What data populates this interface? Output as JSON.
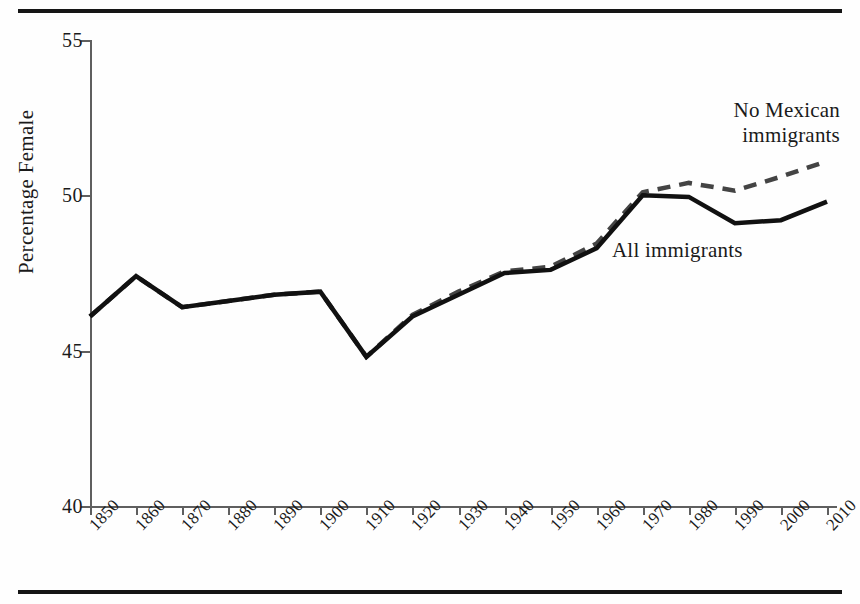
{
  "chart_data": {
    "type": "line",
    "title": "",
    "subtitle": "",
    "xlabel": "",
    "ylabel": "Percentage Female",
    "x": [
      1850,
      1860,
      1870,
      1880,
      1890,
      1900,
      1910,
      1920,
      1930,
      1940,
      1950,
      1960,
      1970,
      1980,
      1990,
      2000,
      2010
    ],
    "xtick_labels": [
      "1850",
      "1860",
      "1870",
      "1880",
      "1890",
      "1900",
      "1910",
      "1920",
      "1930",
      "1940",
      "1950",
      "1960",
      "1970",
      "1980",
      "1990",
      "2000",
      "2010"
    ],
    "ytick_labels": [
      "40",
      "45",
      "50",
      "55"
    ],
    "yticks": [
      40,
      45,
      50,
      55
    ],
    "xlim": [
      1850,
      2010
    ],
    "ylim": [
      40,
      55
    ],
    "grid": false,
    "legend_position": "inline-annotation",
    "series": [
      {
        "name": "All immigrants",
        "style": "solid",
        "color": "#111111",
        "values": [
          46.1,
          47.4,
          46.4,
          46.6,
          46.8,
          46.9,
          44.8,
          46.1,
          46.8,
          47.5,
          47.6,
          48.3,
          50.0,
          49.95,
          49.1,
          49.2,
          49.8
        ]
      },
      {
        "name": "No Mexican immigrants",
        "style": "dashed",
        "color": "#444444",
        "values": [
          46.1,
          47.4,
          46.4,
          46.6,
          46.8,
          46.9,
          44.8,
          46.15,
          46.9,
          47.55,
          47.7,
          48.45,
          50.1,
          50.4,
          50.15,
          50.6,
          51.1
        ]
      }
    ],
    "annotations": [
      {
        "text_line1": "No Mexican",
        "text_line2": "immigrants",
        "series": "No Mexican immigrants"
      },
      {
        "text_line1": "All immigrants",
        "text_line2": "",
        "series": "All immigrants"
      }
    ]
  },
  "axis": {
    "y_title": "Percentage Female",
    "y_ticks": [
      "55",
      "50",
      "45",
      "40"
    ],
    "x_ticks": [
      "1850",
      "1860",
      "1870",
      "1880",
      "1890",
      "1900",
      "1910",
      "1920",
      "1930",
      "1940",
      "1950",
      "1960",
      "1970",
      "1980",
      "1990",
      "2000",
      "2010"
    ]
  },
  "annotations": {
    "no_mexican_line1": "No Mexican",
    "no_mexican_line2": "immigrants",
    "all_immigrants": "All immigrants"
  },
  "colors": {
    "solid_line": "#111111",
    "dashed_line": "#444444",
    "axis": "#5f5f5f",
    "rule": "#151515",
    "text": "#1a1a1a",
    "background": "#fefefe"
  }
}
